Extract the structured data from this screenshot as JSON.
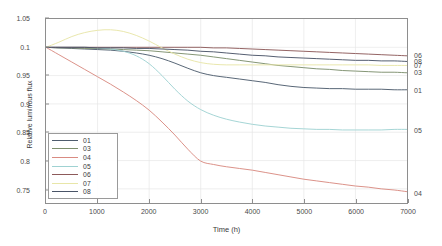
{
  "chart_data": {
    "type": "line",
    "title": "",
    "xlabel": "Time (h)",
    "ylabel": "Relative luminous flux",
    "xlim": [
      0,
      7000
    ],
    "ylim": [
      0.725,
      1.05
    ],
    "grid": true,
    "legend_position": "lower-left",
    "xticks": [
      "0",
      "1000",
      "2000",
      "3000",
      "4000",
      "5000",
      "6000",
      "7000"
    ],
    "xtick_values": [
      0,
      1000,
      2000,
      3000,
      4000,
      5000,
      6000,
      7000
    ],
    "yticks": [
      "1.05",
      "0.1",
      "0.95",
      "0.9",
      "0.85",
      "0.8",
      "0.75"
    ],
    "ytick_values": [
      1.05,
      1.0,
      0.95,
      0.9,
      0.85,
      0.8,
      0.75
    ],
    "x": [
      0,
      250,
      500,
      750,
      1000,
      1250,
      1500,
      1750,
      2000,
      2250,
      2500,
      2750,
      3000,
      3250,
      3500,
      3750,
      4000,
      4250,
      4500,
      4750,
      5000,
      5250,
      5500,
      5750,
      6000,
      6250,
      6500,
      6750,
      7000
    ],
    "series": [
      {
        "name": "01",
        "color": "#4f5d6e",
        "end_value": 0.925,
        "values": [
          1.0,
          0.999,
          0.998,
          0.997,
          0.996,
          0.995,
          0.993,
          0.99,
          0.986,
          0.98,
          0.972,
          0.963,
          0.955,
          0.95,
          0.947,
          0.944,
          0.941,
          0.938,
          0.934,
          0.931,
          0.929,
          0.928,
          0.927,
          0.927,
          0.926,
          0.926,
          0.926,
          0.925,
          0.925
        ]
      },
      {
        "name": "03",
        "color": "#7d8f6d",
        "end_value": 0.955,
        "values": [
          1.0,
          0.999,
          0.999,
          0.998,
          0.998,
          0.997,
          0.996,
          0.995,
          0.994,
          0.992,
          0.99,
          0.988,
          0.986,
          0.983,
          0.98,
          0.977,
          0.974,
          0.971,
          0.968,
          0.966,
          0.964,
          0.962,
          0.961,
          0.959,
          0.958,
          0.957,
          0.956,
          0.956,
          0.955
        ]
      },
      {
        "name": "04",
        "color": "#d98b82",
        "end_value": 0.745,
        "values": [
          1.0,
          0.987,
          0.974,
          0.961,
          0.948,
          0.935,
          0.921,
          0.906,
          0.889,
          0.868,
          0.845,
          0.82,
          0.799,
          0.793,
          0.789,
          0.786,
          0.783,
          0.779,
          0.775,
          0.771,
          0.767,
          0.764,
          0.761,
          0.758,
          0.755,
          0.753,
          0.75,
          0.748,
          0.745
        ]
      },
      {
        "name": "05",
        "color": "#9fd2d2",
        "end_value": 0.855,
        "values": [
          1.0,
          1.0,
          1.0,
          1.0,
          0.999,
          0.997,
          0.993,
          0.985,
          0.971,
          0.95,
          0.926,
          0.905,
          0.89,
          0.88,
          0.873,
          0.868,
          0.864,
          0.861,
          0.859,
          0.857,
          0.856,
          0.855,
          0.855,
          0.854,
          0.854,
          0.854,
          0.854,
          0.855,
          0.855
        ]
      },
      {
        "name": "06",
        "color": "#8d5a5a",
        "end_value": 0.985,
        "values": [
          1.0,
          1.0,
          1.0,
          1.0,
          1.0,
          1.0,
          1.0,
          1.0,
          1.0,
          1.0,
          1.0,
          1.0,
          1.0,
          0.999,
          0.999,
          0.998,
          0.997,
          0.996,
          0.995,
          0.994,
          0.993,
          0.992,
          0.991,
          0.99,
          0.989,
          0.988,
          0.987,
          0.986,
          0.985
        ]
      },
      {
        "name": "07",
        "color": "#e8e6a8",
        "end_value": 0.968,
        "values": [
          1.0,
          1.009,
          1.019,
          1.026,
          1.03,
          1.031,
          1.028,
          1.021,
          1.011,
          0.999,
          0.988,
          0.979,
          0.973,
          0.97,
          0.969,
          0.969,
          0.969,
          0.969,
          0.969,
          0.969,
          0.969,
          0.969,
          0.969,
          0.969,
          0.969,
          0.969,
          0.968,
          0.968,
          0.968
        ]
      },
      {
        "name": "08",
        "color": "#4a5468",
        "end_value": 0.975,
        "values": [
          1.0,
          1.0,
          1.0,
          1.0,
          0.999,
          0.999,
          0.999,
          0.998,
          0.998,
          0.997,
          0.996,
          0.995,
          0.993,
          0.992,
          0.99,
          0.988,
          0.986,
          0.985,
          0.983,
          0.982,
          0.981,
          0.98,
          0.979,
          0.978,
          0.977,
          0.977,
          0.976,
          0.976,
          0.975
        ]
      }
    ]
  },
  "legend": {
    "items": [
      {
        "label": "01"
      },
      {
        "label": "03"
      },
      {
        "label": "04"
      },
      {
        "label": "05"
      },
      {
        "label": "06"
      },
      {
        "label": "07"
      },
      {
        "label": "08"
      }
    ]
  },
  "end_labels": [
    {
      "label": "06",
      "value": 0.985
    },
    {
      "label": "08",
      "value": 0.975
    },
    {
      "label": "07",
      "value": 0.968
    },
    {
      "label": "03",
      "value": 0.955
    },
    {
      "label": "01",
      "value": 0.925
    },
    {
      "label": "05",
      "value": 0.855
    },
    {
      "label": "04",
      "value": 0.745
    }
  ],
  "style": {
    "axis_color": "#8e8e8e",
    "grid_color": "#e6e6e6",
    "text_color": "#3a3a3a",
    "background": "#ffffff"
  }
}
